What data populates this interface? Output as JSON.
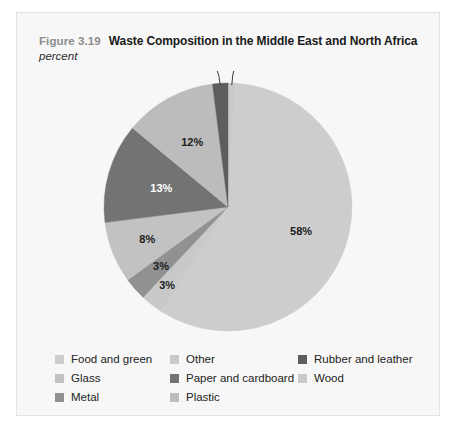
{
  "figure": {
    "number": "Figure 3.19",
    "title": "Waste Composition in the Middle East and North Africa",
    "units": "percent"
  },
  "chart_data": {
    "type": "pie",
    "title": "Waste Composition in the Middle East and North Africa",
    "subtitle": "percent",
    "unit": "percent",
    "legend_position": "bottom",
    "start_angle_deg": 0,
    "direction": "clockwise",
    "categories": [
      "Wood",
      "Food and green",
      "Other",
      "Plastic",
      "Glass",
      "Paper and cardboard",
      "Metal",
      "Rubber and leather"
    ],
    "values": [
      1,
      58,
      3,
      3,
      8,
      13,
      12,
      2
    ],
    "slices": [
      {
        "name": "Wood",
        "value": 1,
        "label": "1%",
        "color": "#c9c9c9",
        "label_color": "#1c1c1c",
        "callout": true
      },
      {
        "name": "Food and green",
        "value": 58,
        "label": "58%",
        "color": "#cdcdcd",
        "label_color": "#1c1c1c",
        "callout": false
      },
      {
        "name": "Other",
        "value": 3,
        "label": "3%",
        "color": "#c9c9c9",
        "label_color": "#1c1c1c",
        "callout": false
      },
      {
        "name": "Plastic",
        "value": 3,
        "label": "3%",
        "color": "#919191",
        "label_color": "#1c1c1c",
        "callout": false
      },
      {
        "name": "Glass",
        "value": 8,
        "label": "8%",
        "color": "#c2c2c2",
        "label_color": "#1c1c1c",
        "callout": false
      },
      {
        "name": "Paper and cardboard",
        "value": 13,
        "label": "13%",
        "color": "#737373",
        "label_color": "#ffffff",
        "callout": false
      },
      {
        "name": "Metal",
        "value": 12,
        "label": "12%",
        "color": "#bcbcbc",
        "label_color": "#1c1c1c",
        "callout": false
      },
      {
        "name": "Rubber and leather",
        "value": 2,
        "label": "2%",
        "color": "#5d5d5d",
        "label_color": "#1c1c1c",
        "callout": true
      }
    ]
  },
  "legend": {
    "rows": [
      [
        {
          "label": "Food and green",
          "color": "#cdcdcd"
        },
        {
          "label": "Other",
          "color": "#c9c9c9"
        },
        {
          "label": "Rubber and leather",
          "color": "#5d5d5d"
        }
      ],
      [
        {
          "label": "Glass",
          "color": "#c2c2c2"
        },
        {
          "label": "Paper and cardboard",
          "color": "#737373"
        },
        {
          "label": "Wood",
          "color": "#c9c9c9"
        }
      ],
      [
        {
          "label": "Metal",
          "color": "#919191"
        },
        {
          "label": "Plastic",
          "color": "#bcbcbc"
        },
        {
          "label": "",
          "color": ""
        }
      ]
    ]
  },
  "colors": {
    "panel_background": "#f7f7f7",
    "panel_border": "#e2e2e2",
    "figure_number": "#8c8c8c",
    "title": "#1a1a1a"
  }
}
